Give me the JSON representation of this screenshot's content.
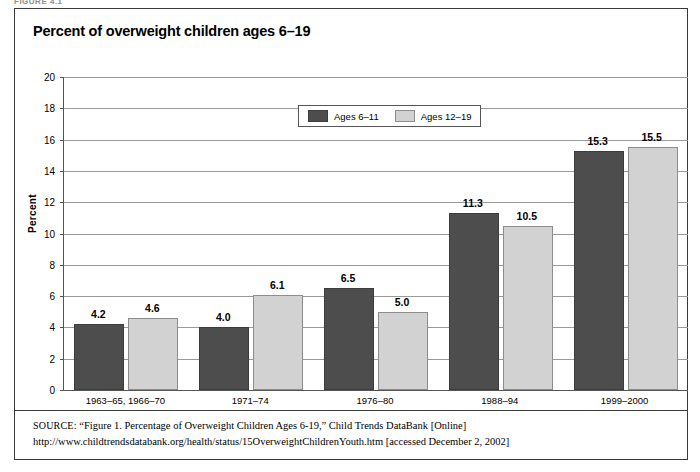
{
  "figure_tag": "FIGURE 4.1",
  "title": "Percent of overweight children ages 6–19",
  "source": {
    "label": "SOURCE:",
    "text": " “Figure 1. Percentage of Overweight Children Ages 6-19,” Child Trends DataBank [Online] http://www.childtrendsdatabank.org/health/status/15OverweightChildrenYouth.htm [accessed December 2, 2002]"
  },
  "chart_data": {
    "type": "bar",
    "title": "Percent of overweight children ages 6–19",
    "xlabel": "",
    "ylabel": "Percent",
    "ylim": [
      0,
      20
    ],
    "ytick_values": [
      0,
      2,
      4,
      6,
      8,
      10,
      12,
      14,
      16,
      18,
      20
    ],
    "ytick_labels": [
      "0",
      "2",
      "4",
      "6",
      "8",
      "10",
      "12",
      "14",
      "16",
      "18",
      "20"
    ],
    "grid": true,
    "legend_position": "upper center",
    "categories": [
      "1963–65, 1966–70",
      "1971–74",
      "1976–80",
      "1988–94",
      "1999–2000"
    ],
    "series": [
      {
        "name": "Ages 6–11",
        "color": "#4d4d4d",
        "values": [
          4.2,
          4.0,
          6.5,
          11.3,
          15.3
        ],
        "labels": [
          "4.2",
          "4.0",
          "6.5",
          "11.3",
          "15.3"
        ]
      },
      {
        "name": "Ages 12–19",
        "color": "#d2d2d2",
        "values": [
          4.6,
          6.1,
          5.0,
          10.5,
          15.5
        ],
        "labels": [
          "4.6",
          "6.1",
          "5.0",
          "10.5",
          "15.5"
        ]
      }
    ]
  }
}
